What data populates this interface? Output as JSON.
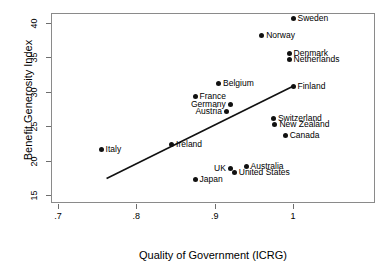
{
  "chart_data": {
    "type": "scatter",
    "title": "",
    "xlabel": "Quality of Government (ICRG)",
    "ylabel": "Benefit Generosity Index",
    "xlim": [
      0.7,
      1.045
    ],
    "ylim": [
      14.3,
      41.8
    ],
    "xticks": [
      ".7",
      ".8",
      ".9",
      "1"
    ],
    "xtick_values": [
      0.7,
      0.8,
      0.9,
      1.0
    ],
    "yticks": [
      "15",
      "20",
      "25",
      "30",
      "35",
      "40"
    ],
    "ytick_values": [
      15,
      20,
      25,
      30,
      35,
      40
    ],
    "grid": false,
    "legend": "none",
    "marker_color": "#111111",
    "frame_color": "#8a8a8a",
    "points": [
      {
        "label": "Sweden",
        "x": 1.0,
        "y": 40.7,
        "side": "right"
      },
      {
        "label": "Norway",
        "x": 0.96,
        "y": 38.2,
        "side": "right"
      },
      {
        "label": "Denmark",
        "x": 0.995,
        "y": 35.5,
        "side": "right"
      },
      {
        "label": "Netherlands",
        "x": 0.995,
        "y": 34.7,
        "side": "right"
      },
      {
        "label": "Belgium",
        "x": 0.905,
        "y": 31.2,
        "side": "right"
      },
      {
        "label": "Finland",
        "x": 1.0,
        "y": 30.8,
        "side": "right"
      },
      {
        "label": "France",
        "x": 0.875,
        "y": 29.3,
        "side": "right"
      },
      {
        "label": "Germany",
        "x": 0.92,
        "y": 28.2,
        "side": "left"
      },
      {
        "label": "Austria",
        "x": 0.915,
        "y": 27.2,
        "side": "left"
      },
      {
        "label": "Switzerland",
        "x": 0.975,
        "y": 26.1,
        "side": "right"
      },
      {
        "label": "New Zealand",
        "x": 0.977,
        "y": 25.3,
        "side": "right"
      },
      {
        "label": "Canada",
        "x": 0.99,
        "y": 23.6,
        "side": "right"
      },
      {
        "label": "Ireland",
        "x": 0.845,
        "y": 22.3,
        "side": "right"
      },
      {
        "label": "Italy",
        "x": 0.755,
        "y": 21.6,
        "side": "right"
      },
      {
        "label": "Australia",
        "x": 0.94,
        "y": 19.2,
        "side": "right"
      },
      {
        "label": "UK",
        "x": 0.92,
        "y": 18.9,
        "side": "left"
      },
      {
        "label": "United States",
        "x": 0.925,
        "y": 18.3,
        "side": "right"
      },
      {
        "label": "Japan",
        "x": 0.875,
        "y": 17.3,
        "side": "right"
      }
    ],
    "fit_line": {
      "type": "linear-fit",
      "x_start": 0.762,
      "y_start": 17.4,
      "x_end": 1.0,
      "y_end": 30.8,
      "color": "#111111"
    }
  }
}
